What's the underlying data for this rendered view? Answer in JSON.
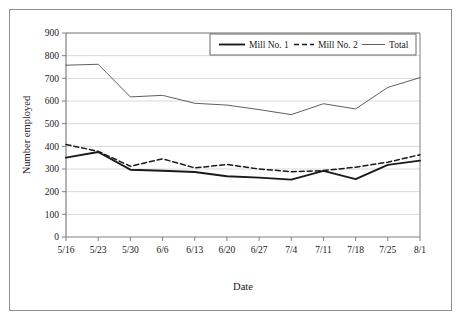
{
  "chart_data": {
    "type": "line",
    "title": "",
    "xlabel": "Date",
    "ylabel": "Number employed",
    "categories": [
      "5/16",
      "5/23",
      "5/30",
      "6/6",
      "6/13",
      "6/20",
      "6/27",
      "7/4",
      "7/11",
      "7/18",
      "7/25",
      "8/1"
    ],
    "series": [
      {
        "name": "Mill No. 1",
        "style": "solid-thick",
        "color": "#1a1a1a",
        "values": [
          350,
          375,
          297,
          292,
          287,
          268,
          262,
          253,
          292,
          255,
          318,
          337
        ]
      },
      {
        "name": "Mill No. 2",
        "style": "dashed",
        "color": "#1a1a1a",
        "values": [
          408,
          378,
          312,
          345,
          305,
          320,
          300,
          288,
          293,
          308,
          330,
          363
        ]
      },
      {
        "name": "Total",
        "style": "solid-thin",
        "color": "#4d4d4d",
        "values": [
          758,
          762,
          618,
          625,
          590,
          582,
          562,
          540,
          588,
          565,
          660,
          703
        ]
      }
    ],
    "ylim": [
      0,
      900
    ],
    "yticks": [
      0,
      100,
      200,
      300,
      400,
      500,
      600,
      700,
      800,
      900
    ],
    "ytick_labels": [
      "0",
      "100",
      "200",
      "300",
      "400",
      "500",
      "600",
      "700",
      "800",
      "900"
    ],
    "grid": "horizontal",
    "grid_color": "#d9d9d9",
    "legend_position": "top-right",
    "axis_color": "#808080",
    "background": "#ffffff"
  },
  "legend": {
    "entries": [
      {
        "label": "Mill No. 1"
      },
      {
        "label": "Mill No. 2"
      },
      {
        "label": "Total"
      }
    ]
  },
  "axes": {
    "x_title": "Date",
    "y_title": "Number employed"
  }
}
